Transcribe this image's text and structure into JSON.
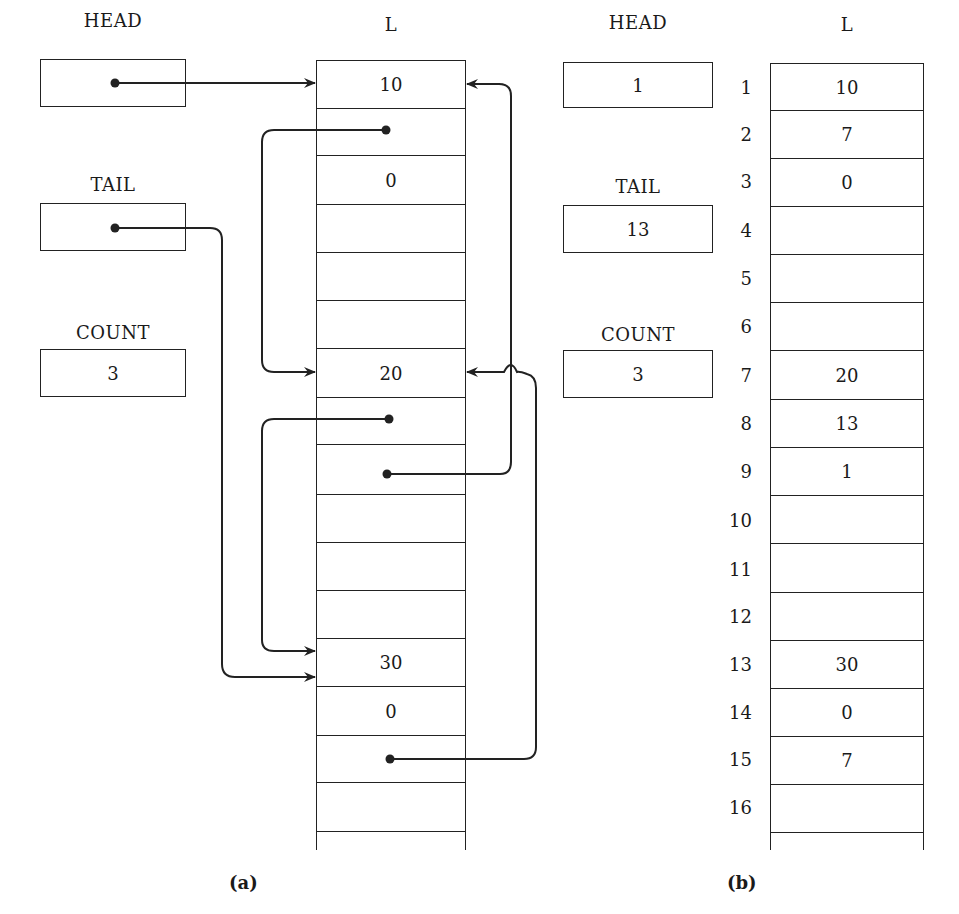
{
  "panel_a": {
    "caption": "(a)",
    "head": {
      "label": "HEAD",
      "value": ""
    },
    "tail": {
      "label": "TAIL",
      "value": ""
    },
    "count": {
      "label": "COUNT",
      "value": "3"
    },
    "array_label": "L",
    "cells": [
      "10",
      "",
      "0",
      "",
      "",
      "",
      "20",
      "",
      "",
      "",
      "",
      "",
      "30",
      "0",
      "",
      "",
      ""
    ]
  },
  "panel_b": {
    "caption": "(b)",
    "head": {
      "label": "HEAD",
      "value": "1"
    },
    "tail": {
      "label": "TAIL",
      "value": "13"
    },
    "count": {
      "label": "COUNT",
      "value": "3"
    },
    "array_label": "L",
    "indices": [
      "1",
      "2",
      "3",
      "4",
      "5",
      "6",
      "7",
      "8",
      "9",
      "10",
      "11",
      "12",
      "13",
      "14",
      "15",
      "16"
    ],
    "cells": [
      "10",
      "7",
      "0",
      "",
      "",
      "",
      "20",
      "13",
      "1",
      "",
      "",
      "",
      "30",
      "0",
      "7",
      "",
      ""
    ]
  },
  "pointers_a": [
    {
      "from": "HEAD",
      "to_cell": 1
    },
    {
      "from": "TAIL",
      "to_cell": 13
    },
    {
      "from_cell": 2,
      "to_cell": 7
    },
    {
      "from_cell": 8,
      "to_cell": 13
    },
    {
      "from_cell": 9,
      "to_cell": 1
    },
    {
      "from_cell": 15,
      "to_cell": 7
    }
  ]
}
